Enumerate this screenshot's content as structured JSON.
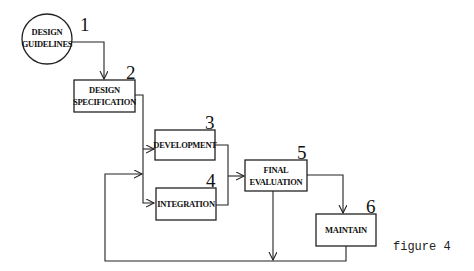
{
  "diagram": {
    "type": "flowchart",
    "caption": "figure 4",
    "nodes": [
      {
        "id": 1,
        "number": "1",
        "shape": "circle",
        "line1": "DESIGN",
        "line2": "GUIDELINES"
      },
      {
        "id": 2,
        "number": "2",
        "shape": "rect",
        "line1": "DESIGN",
        "line2": "SPECIFICATION"
      },
      {
        "id": 3,
        "number": "3",
        "shape": "rect",
        "line1": "DEVELOPMENT"
      },
      {
        "id": 4,
        "number": "4",
        "shape": "rect",
        "line1": "INTEGRATION"
      },
      {
        "id": 5,
        "number": "5",
        "shape": "rect",
        "line1": "FINAL",
        "line2": "EVALUATION"
      },
      {
        "id": 6,
        "number": "6",
        "shape": "rect",
        "line1": "MAINTAIN"
      }
    ],
    "edges": [
      {
        "from": 1,
        "to": 2
      },
      {
        "from": 2,
        "to": 3
      },
      {
        "from": 2,
        "to": 4
      },
      {
        "from": 3,
        "to": 5
      },
      {
        "from": 4,
        "to": 5
      },
      {
        "from": 5,
        "to": 6
      },
      {
        "from": 5,
        "to": "feedback-loop"
      },
      {
        "from": 6,
        "to": "feedback-loop"
      },
      {
        "from": "feedback-loop",
        "to": "2-4 junction"
      }
    ]
  }
}
